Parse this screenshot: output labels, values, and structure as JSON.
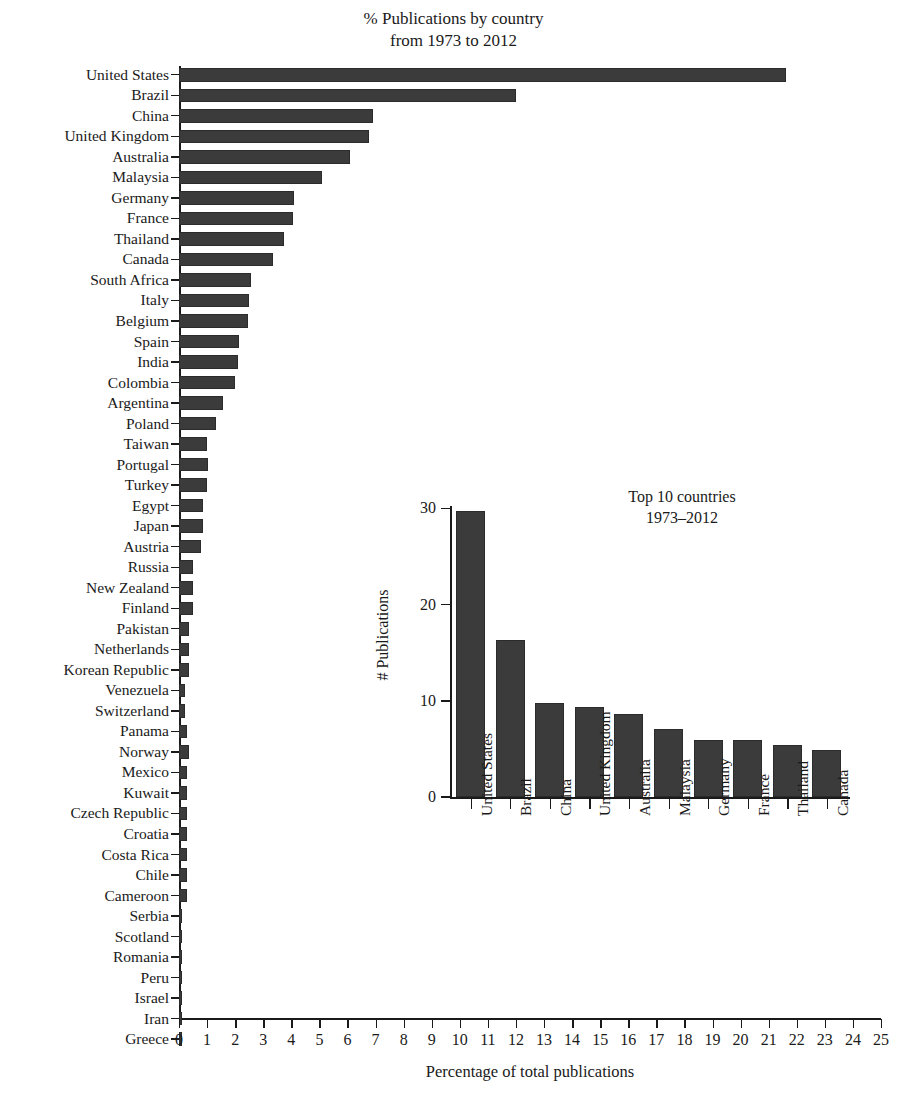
{
  "figure": {
    "title_lines": [
      "% Publications by country",
      "from 1973 to 2012"
    ],
    "bar_color": "#3b3b3b",
    "axis_color": "#1a1a1a",
    "background": "#ffffff"
  },
  "chart_data": [
    {
      "type": "bar",
      "orientation": "horizontal",
      "title": "% Publications by country from 1973 to 2012",
      "xlabel": "Percentage of total publications",
      "ylabel": "",
      "xlim": [
        0,
        25
      ],
      "xticks": [
        0,
        1,
        2,
        3,
        4,
        5,
        6,
        7,
        8,
        9,
        10,
        11,
        12,
        13,
        14,
        15,
        16,
        17,
        18,
        19,
        20,
        21,
        22,
        23,
        24,
        25
      ],
      "xtick_labels": [
        "0",
        "1",
        "2",
        "3",
        "4",
        "5",
        "6",
        "7",
        "8",
        "9",
        "10",
        "11",
        "12",
        "13",
        "14",
        "15",
        "16",
        "17",
        "18",
        "19",
        "20",
        "21",
        "22",
        "23",
        "24",
        "25"
      ],
      "grid": false,
      "legend": null,
      "categories": [
        "United States",
        "Brazil",
        "China",
        "United Kingdom",
        "Australia",
        "Malaysia",
        "Germany",
        "France",
        "Thailand",
        "Canada",
        "South Africa",
        "Italy",
        "Belgium",
        "Spain",
        "India",
        "Colombia",
        "Argentina",
        "Poland",
        "Taiwan",
        "Portugal",
        "Turkey",
        "Egypt",
        "Japan",
        "Austria",
        "Russia",
        "New Zealand",
        "Finland",
        "Pakistan",
        "Netherlands",
        "Korean Republic",
        "Venezuela",
        "Switzerland",
        "Panama",
        "Norway",
        "Mexico",
        "Kuwait",
        "Czech Republic",
        "Croatia",
        "Costa Rica",
        "Chile",
        "Cameroon",
        "Serbia",
        "Scotland",
        "Romania",
        "Peru",
        "Israel",
        "Iran",
        "Greece"
      ],
      "values": [
        21.6,
        12.0,
        6.9,
        6.75,
        6.1,
        5.1,
        4.1,
        4.05,
        3.75,
        3.35,
        2.55,
        2.5,
        2.45,
        2.15,
        2.1,
        2.0,
        1.55,
        1.3,
        1.0,
        1.05,
        1.0,
        0.85,
        0.85,
        0.8,
        0.5,
        0.5,
        0.5,
        0.35,
        0.35,
        0.35,
        0.2,
        0.2,
        0.3,
        0.35,
        0.3,
        0.3,
        0.3,
        0.3,
        0.3,
        0.3,
        0.3,
        0.1,
        0.1,
        0.1,
        0.1,
        0.1,
        0.1,
        0.1
      ]
    },
    {
      "type": "bar",
      "orientation": "vertical",
      "title_lines": [
        "Top 10 countries",
        "1973–2012"
      ],
      "title": "Top 10 countries 1973-2012",
      "xlabel": "",
      "ylabel": "# Publications",
      "ylim": [
        0,
        30
      ],
      "yticks": [
        0,
        10,
        20,
        30
      ],
      "ytick_labels": [
        "0",
        "10",
        "20",
        "30"
      ],
      "grid": false,
      "legend": null,
      "categories": [
        "United States",
        "Brazil",
        "China",
        "United Kingdom",
        "Australia",
        "Malaysia",
        "Germany",
        "France",
        "Thailand",
        "Canada"
      ],
      "values": [
        29.7,
        16.3,
        9.8,
        9.4,
        8.6,
        7.1,
        5.9,
        5.9,
        5.4,
        4.9
      ]
    }
  ]
}
